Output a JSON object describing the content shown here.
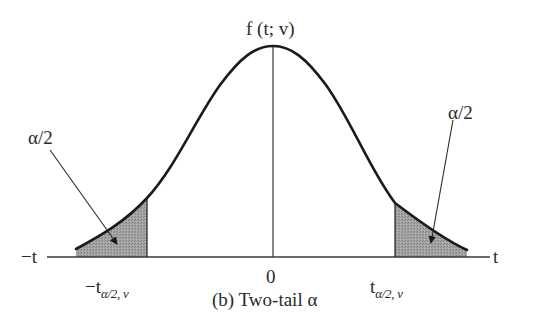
{
  "figure": {
    "y_label": "f (t; v)",
    "caption": "(b) Two-tail α",
    "axis": {
      "left_label": "−t",
      "right_label": "t",
      "center_tick": "0",
      "left_critical": {
        "main": "−t",
        "subscript": "α/2, v"
      },
      "right_critical": {
        "main": "t",
        "subscript": "α/2, v"
      }
    },
    "annotations": {
      "left_tail": "α/2",
      "right_tail": "α/2"
    },
    "colors": {
      "curve": "#1a1a1a",
      "shade": "#9a9a9a",
      "axis": "#3a3a3a",
      "text": "#2a2a2a"
    }
  }
}
